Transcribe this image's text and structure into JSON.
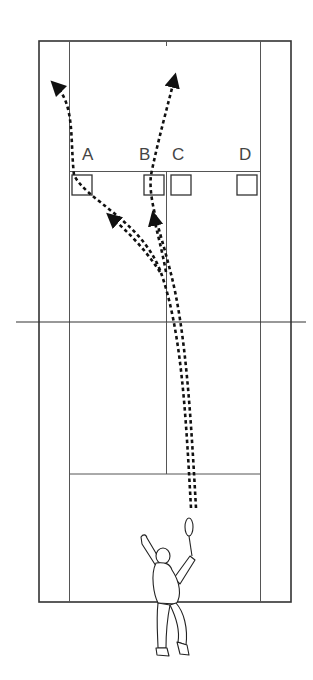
{
  "diagram": {
    "type": "tennis-court-serve-targets",
    "colors": {
      "background": "#ffffff",
      "court_line": "#333333",
      "thin_line": "#555555",
      "trajectory": "#111111",
      "label": "#444444"
    },
    "targets": [
      {
        "label": "A",
        "x": 73,
        "y": 174
      },
      {
        "label": "B",
        "x": 143,
        "y": 174
      },
      {
        "label": "C",
        "x": 170,
        "y": 174
      },
      {
        "label": "D",
        "x": 236,
        "y": 174
      }
    ],
    "labels": {
      "a": "A",
      "b": "B",
      "c": "C",
      "d": "D"
    },
    "trajectories": [
      {
        "name": "serve-to-A-deep",
        "description": "curved dashed path from server to deep left, through target A"
      },
      {
        "name": "serve-to-B-deep",
        "description": "curved dashed path from server to deep center, through target B"
      },
      {
        "name": "serve-to-A",
        "description": "dashed path with arrow toward target A"
      },
      {
        "name": "serve-to-B",
        "description": "dashed path with arrow toward target B"
      }
    ],
    "figure": "tennis player serving with racket raised"
  }
}
